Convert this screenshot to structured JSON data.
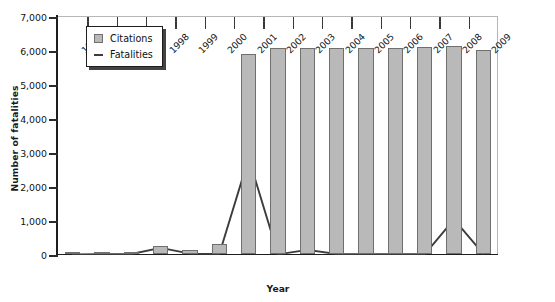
{
  "chart_data": {
    "type": "bar",
    "title": "",
    "xlabel": "Year",
    "ylabel": "Number of fatalities",
    "categories": [
      "1995",
      "1996",
      "1997",
      "1998",
      "1999",
      "2000",
      "2001",
      "2002",
      "2003",
      "2004",
      "2005",
      "2006",
      "2007",
      "2008",
      "2009"
    ],
    "ylim": [
      0,
      7000
    ],
    "yticks": [
      0,
      1000,
      2000,
      3000,
      4000,
      5000,
      6000,
      7000
    ],
    "ytick_labels": [
      "0",
      "1,000",
      "2,000",
      "3,000",
      "4,000",
      "5,000",
      "6,000",
      "7,000"
    ],
    "grid": false,
    "legend_position": "top-left",
    "series": [
      {
        "name": "Citations",
        "kind": "bar",
        "color": "#b9b9b9",
        "edge_color": "#6f6f6f",
        "values": [
          20,
          20,
          30,
          250,
          110,
          300,
          5880,
          6050,
          6060,
          6060,
          6060,
          6060,
          6100,
          6120,
          6000
        ]
      },
      {
        "name": "Fatalities",
        "kind": "line",
        "color": "#3c3c3c",
        "values": [
          15,
          20,
          30,
          210,
          40,
          30,
          2850,
          20,
          150,
          30,
          25,
          25,
          20,
          1050,
          30
        ]
      }
    ]
  },
  "legend": {
    "items": [
      {
        "label": "Citations",
        "marker": "square-swatch"
      },
      {
        "label": "Fatalities",
        "marker": "line-swatch"
      }
    ]
  },
  "axes": {
    "y_title": "Number of fatalities",
    "x_title": "Year"
  }
}
